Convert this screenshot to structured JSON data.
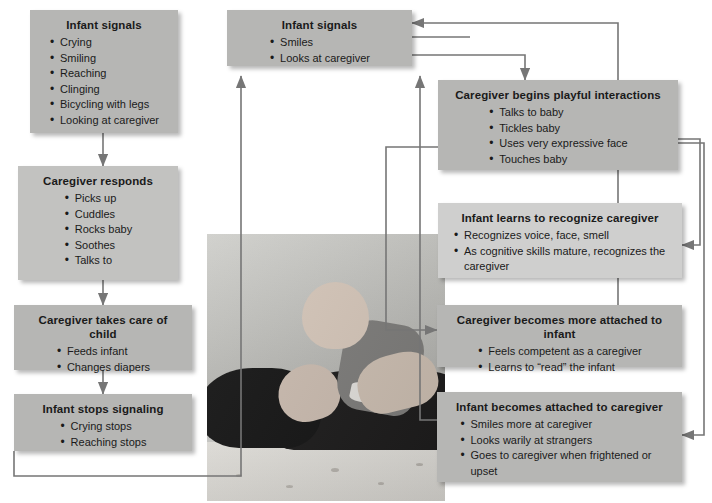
{
  "diagram": {
    "colors": {
      "box_fill": "#b6b6b4",
      "box_fill_light": "#cfcfce",
      "connector": "#767676",
      "text": "#1a1a1a",
      "background": "#ffffff"
    },
    "boxes": [
      {
        "id": "infant-signals-left",
        "title": "Infant signals",
        "items": [
          "Crying",
          "Smiling",
          "Reaching",
          "Clinging",
          "Bicycling with legs",
          "Looking at caregiver"
        ]
      },
      {
        "id": "caregiver-responds",
        "title": "Caregiver responds",
        "items": [
          "Picks up",
          "Cuddles",
          "Rocks baby",
          "Soothes",
          "Talks to"
        ]
      },
      {
        "id": "caregiver-takes-care",
        "title": "Caregiver takes care of child",
        "items": [
          "Feeds infant",
          "Changes diapers"
        ]
      },
      {
        "id": "infant-stops-signaling",
        "title": "Infant stops signaling",
        "items": [
          "Crying stops",
          "Reaching stops"
        ]
      },
      {
        "id": "infant-signals-top",
        "title": "Infant signals",
        "items": [
          "Smiles",
          "Looks at caregiver"
        ]
      },
      {
        "id": "caregiver-playful",
        "title": "Caregiver begins playful interactions",
        "items": [
          "Talks to baby",
          "Tickles baby",
          "Uses very expressive face",
          "Touches baby"
        ]
      },
      {
        "id": "infant-recognizes",
        "title": "Infant learns to recognize caregiver",
        "items": [
          "Recognizes voice, face, smell",
          "As cognitive skills mature, recognizes the caregiver"
        ]
      },
      {
        "id": "caregiver-attached",
        "title": "Caregiver becomes more attached to infant",
        "items": [
          "Feels competent as a caregiver",
          "Learns to “read” the infant"
        ]
      },
      {
        "id": "infant-attached",
        "title": "Infant becomes attached to caregiver",
        "items": [
          "Smiles more at caregiver",
          "Looks warily at strangers",
          "Goes to caregiver when frightened or upset"
        ]
      }
    ],
    "photo": {
      "caption": "Black-and-white photograph of a mother lying on a bed holding a smiling baby above her face"
    }
  }
}
